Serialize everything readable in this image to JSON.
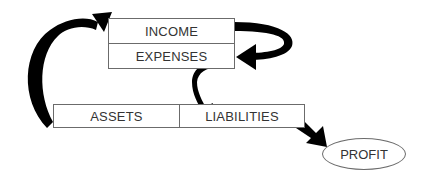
{
  "diagram": {
    "nodes": {
      "income": {
        "label": "INCOME"
      },
      "expenses": {
        "label": "EXPENSES"
      },
      "assets": {
        "label": "ASSETS"
      },
      "liabilities": {
        "label": "LIABILITIES"
      },
      "profit": {
        "label": "PROFIT"
      }
    },
    "edges": [
      {
        "from": "assets",
        "to": "income",
        "style": "thick-curved-arrow"
      },
      {
        "from": "income",
        "to": "expenses",
        "style": "thick-curved-arrow"
      },
      {
        "from": "expenses",
        "to": "liabilities",
        "style": "thin-curved-arrow"
      },
      {
        "from": "liabilities",
        "to": "profit",
        "style": "thick-straight-arrow"
      }
    ],
    "colors": {
      "stroke": "#000000",
      "border": "#6b6b6b",
      "text": "#333333"
    }
  }
}
